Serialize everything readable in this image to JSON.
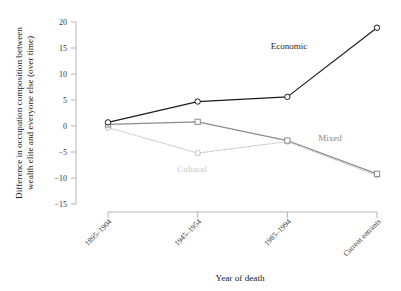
{
  "chart_data": {
    "type": "line",
    "title": "",
    "xlabel": "Year of death",
    "ylabel": "Difference in occupation composition between wealth elite and everyone else (over time)",
    "categories": [
      "1895–1904",
      "1945–1954",
      "1985–1994",
      "Current entrants"
    ],
    "ylim": [
      -15,
      20
    ],
    "yticks": [
      20,
      15,
      10,
      5,
      0,
      -5,
      -10,
      -15
    ],
    "ytick_labels": [
      "20",
      "15",
      "10",
      "5",
      "0",
      "−5",
      "−10",
      "−15"
    ],
    "grid": false,
    "legend_position": "inline-annotations",
    "series": [
      {
        "name": "Economic",
        "values": [
          0.7,
          4.7,
          5.6,
          18.9
        ],
        "color": "#1c1c1c",
        "line_style": "solid",
        "marker": "circle"
      },
      {
        "name": "Mixed",
        "values": [
          0.3,
          0.8,
          -2.8,
          -9.2
        ],
        "color": "#8c8c8c",
        "line_style": "solid",
        "marker": "square"
      },
      {
        "name": "Cultural",
        "values": [
          -0.3,
          -5.2,
          -3.0,
          -9.5
        ],
        "color": "#c4c4c4",
        "line_style": "dotted",
        "marker": "circle"
      }
    ],
    "annotations": [
      {
        "text": "Economic",
        "color": "#1c1c1c",
        "x": 289,
        "y": 49
      },
      {
        "text": "Mixed",
        "color": "#8a8a8a",
        "x": 330,
        "y": 141
      },
      {
        "text": "Cultural",
        "color": "#c9c9c9",
        "x": 192,
        "y": 172
      }
    ],
    "axis_color": "#b5b5b5"
  }
}
